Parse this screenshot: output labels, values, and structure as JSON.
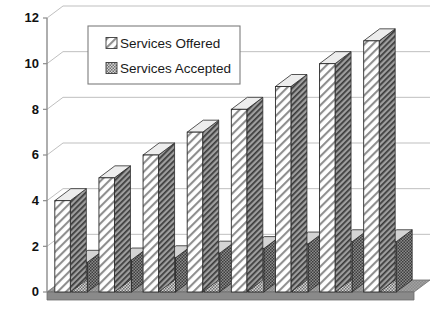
{
  "chart_data": {
    "type": "bar",
    "title": "",
    "xlabel": "",
    "ylabel": "",
    "ylim": [
      0,
      12
    ],
    "yticks": [
      0,
      2,
      4,
      6,
      8,
      10,
      12
    ],
    "grid": true,
    "legend_position": "top-left-inside",
    "style": "3d-hatched-column",
    "categories": [
      "1",
      "2",
      "3",
      "4",
      "5",
      "6",
      "7",
      "8"
    ],
    "xtick_labels_visible": false,
    "series": [
      {
        "name": "Services Offered",
        "pattern": "diagonal-hatch",
        "color": "#ffffff",
        "values": [
          4,
          5,
          6,
          7,
          8,
          9,
          10,
          11
        ]
      },
      {
        "name": "Services Accepted",
        "pattern": "checker-dot",
        "color": "#b0b0b0",
        "values": [
          1.3,
          1.4,
          1.5,
          1.7,
          1.9,
          2.1,
          2.2,
          2.2
        ]
      }
    ]
  },
  "legend": {
    "items": [
      {
        "label": "Services Offered",
        "swatch": "diagonal-hatch"
      },
      {
        "label": "Services Accepted",
        "swatch": "checker-dot"
      }
    ]
  },
  "axis": {
    "y_labels": [
      "12",
      "10",
      "8",
      "6",
      "4",
      "2",
      "0"
    ]
  },
  "colors": {
    "axis_line": "#8c8c8c",
    "gridline": "#b8b8b8",
    "bar_outline": "#2b2b2b",
    "offered_face": "#ffffff",
    "offered_side": "#9a9a9a",
    "offered_top": "#e8e8e8",
    "accepted_face": "#c9c9c9",
    "accepted_side": "#6f6f6f",
    "accepted_top": "#d8d8d8",
    "floor_top": "#9d9d9d",
    "floor_front": "#8a8a8a",
    "text": "#111111"
  }
}
